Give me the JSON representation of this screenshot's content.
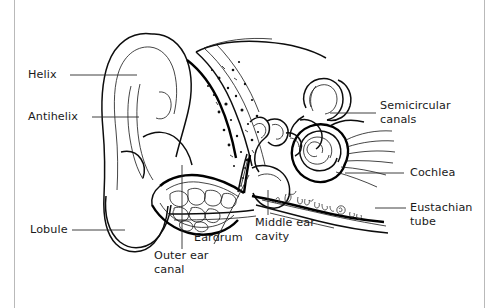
{
  "figure": {
    "background_color": "#ffffff",
    "ink_color": "#0d0d0d",
    "rule_color": "#b9b9b9",
    "signature": "A. Friesen © '92"
  },
  "labels": {
    "helix": "Helix",
    "antihelix": "Antihelix",
    "lobule": "Lobule",
    "outer_ear_canal": "Outer ear\ncanal",
    "eardrum": "Eardrum",
    "middle_ear_cavity": "Middle ear\ncavity",
    "semicircular_canals": "Semicircular\ncanals",
    "cochlea": "Cochlea",
    "eustachian_tube": "Eustachian\ntube"
  }
}
